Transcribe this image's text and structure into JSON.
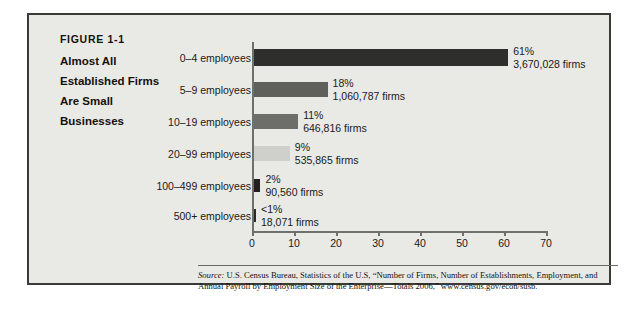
{
  "figure": {
    "number": "FIGURE 1-1",
    "title_lines": [
      "Almost All",
      "Established Firms",
      "Are Small",
      "Businesses"
    ]
  },
  "source": {
    "label": "Source:",
    "text": " U.S. Census Bureau, Statistics of the U.S, “Number of Firms, Number of Establishments, Employment, and Annual Payroll by Employment Size of the Enterprise—Totals 2006,” www.census.gov/econ/susb."
  },
  "chart_data": {
    "type": "bar",
    "orientation": "horizontal",
    "title": "Almost All Established Firms Are Small Businesses",
    "xlabel": "",
    "ylabel": "",
    "xlim": [
      0,
      70
    ],
    "xticks": [
      0,
      10,
      20,
      30,
      40,
      50,
      60,
      70
    ],
    "grid": false,
    "legend": false,
    "categories": [
      "0–4 employees",
      "5–9 employees",
      "10–19 employees",
      "20–99 employees",
      "100–499 employees",
      "500+ employees"
    ],
    "values": [
      61,
      18,
      11,
      9,
      2,
      0.5
    ],
    "percent_labels": [
      "61%",
      "18%",
      "11%",
      "9%",
      "2%",
      "<1%"
    ],
    "firm_labels": [
      "3,670,028 firms",
      "1,060,787 firms",
      "646,816 firms",
      "535,865 firms",
      "90,560 firms",
      "18,071 firms"
    ],
    "firm_counts": [
      3670028,
      1060787,
      646816,
      535865,
      90560,
      18071
    ],
    "bar_colors": [
      "#2e2e2c",
      "#5f5f5c",
      "#6d6d6a",
      "#cfcfcb",
      "#231f1e",
      "#2b2826"
    ]
  },
  "colors": {
    "panel_background": "#e9e9e6",
    "panel_border": "#3a3a38",
    "axis": "#6f6f6c",
    "text": "#1a1a18"
  }
}
